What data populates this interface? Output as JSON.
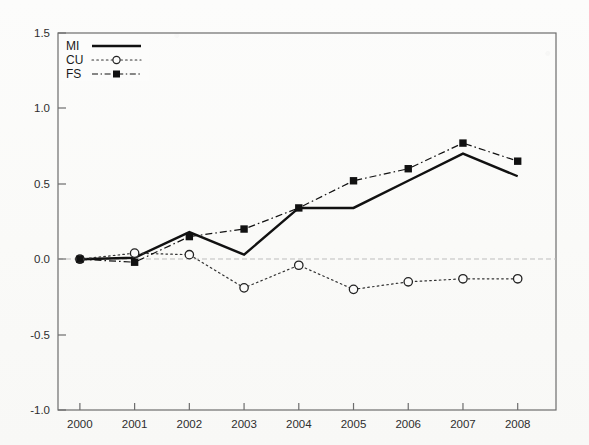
{
  "chart_data": {
    "type": "line",
    "title": "",
    "xlabel": "",
    "ylabel": "",
    "categories": [
      "2000",
      "2001",
      "2002",
      "2003",
      "2004",
      "2005",
      "2006",
      "2007",
      "2008"
    ],
    "x": [
      2000,
      2001,
      2002,
      2003,
      2004,
      2005,
      2006,
      2007,
      2008
    ],
    "xlim": [
      1999.6,
      2008.7
    ],
    "ylim": [
      -1.0,
      1.5
    ],
    "yticks": [
      "1.5",
      "1.0",
      "0.5",
      "0.0",
      "-0.5",
      "-1.0"
    ],
    "ytick_values": [
      1.5,
      1.0,
      0.5,
      0.0,
      -0.5,
      -1.0
    ],
    "grid": false,
    "zero_reference_line": 0.0,
    "legend_position": "top-left",
    "series": [
      {
        "name": "MI",
        "style": "solid",
        "marker": "none",
        "color": "#111111",
        "values": [
          0.0,
          0.01,
          0.18,
          0.03,
          0.34,
          0.34,
          0.52,
          0.7,
          0.55
        ]
      },
      {
        "name": "CU",
        "style": "dotted",
        "marker": "open-circle",
        "color": "#333333",
        "values": [
          0.0,
          0.04,
          0.03,
          -0.19,
          -0.04,
          -0.2,
          -0.15,
          -0.13,
          -0.13
        ]
      },
      {
        "name": "FS",
        "style": "dash-dot",
        "marker": "filled-square",
        "color": "#111111",
        "values": [
          0.0,
          -0.02,
          0.15,
          0.2,
          0.34,
          0.52,
          0.6,
          0.77,
          0.65
        ]
      }
    ]
  },
  "legend": {
    "entries": [
      {
        "label": "MI",
        "sample": "solid-line-sample"
      },
      {
        "label": "CU",
        "sample": "dotted-open-circle-sample"
      },
      {
        "label": "FS",
        "sample": "dash-dot-filled-square-sample"
      }
    ]
  },
  "axes": {
    "y_tick_labels": [
      "1.5",
      "1.0",
      "0.5",
      "0.0",
      "-0.5",
      "-1.0"
    ],
    "x_tick_labels": [
      "2000",
      "2001",
      "2002",
      "2003",
      "2004",
      "2005",
      "2006",
      "2007",
      "2008"
    ]
  },
  "colors": {
    "frame": "#6d6d6d",
    "zero_line": "#b8b8b8",
    "ink": "#111111",
    "background": "#fbfbfa"
  }
}
